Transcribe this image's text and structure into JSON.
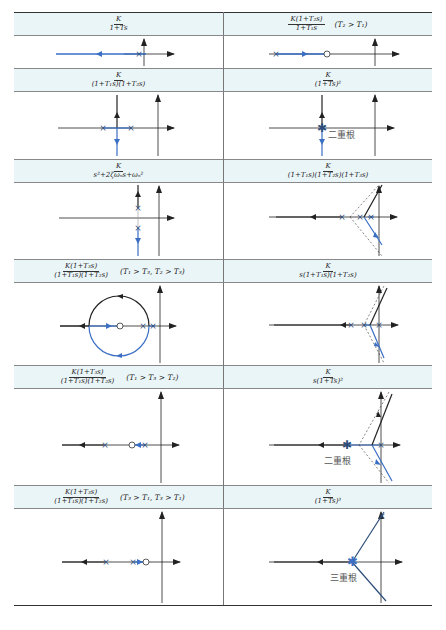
{
  "page_number": "",
  "colors": {
    "locus_blue": "#3a6fc4",
    "locus_black": "#222222",
    "header_bg": "#eaf5f8",
    "pole_marker": "#2d4d7a"
  },
  "rows": [
    {
      "left": {
        "num": "K",
        "den": "1+Ts",
        "condition": ""
      },
      "right": {
        "num": "K(1+T₂s)",
        "den": "1+T₁s",
        "condition": "(T₂ > T₁)"
      }
    },
    {
      "left": {
        "num": "K",
        "den": "(1+T₁s)(1+T₂s)",
        "condition": ""
      },
      "right": {
        "num": "K",
        "den": "(1+Ts)²",
        "condition": "",
        "annotation": "二重根"
      }
    },
    {
      "left": {
        "num": "K",
        "den": "s²+2ζωₙs+ωₙ²",
        "condition": ""
      },
      "right": {
        "num": "K",
        "den": "(1+T₁s)(1+T₂s)(1+T₃s)",
        "condition": ""
      }
    },
    {
      "left": {
        "num": "K(1+T₃s)",
        "den": "(1+T₁s)(1+T₂s)",
        "condition": "(T₁ > T₃, T₂ > T₃)"
      },
      "right": {
        "num": "K",
        "den": "s(1+T₁s)(1+T₂s)",
        "condition": ""
      }
    },
    {
      "left": {
        "num": "K(1+T₃s)",
        "den": "(1+T₁s)(1+T₂s)",
        "condition": "(T₁ > T₃ > T₂)"
      },
      "right": {
        "num": "K",
        "den": "s(1+Ts)²",
        "condition": "",
        "annotation": "二重根"
      }
    },
    {
      "left": {
        "num": "K(1+T₃s)",
        "den": "(1+T₁s)(1+T₂s)",
        "condition": "(T₃ > T₁, T₃ > T₁)"
      },
      "right": {
        "num": "K",
        "den": "(1+Ts)³",
        "condition": "",
        "annotation": "三重根"
      }
    }
  ]
}
